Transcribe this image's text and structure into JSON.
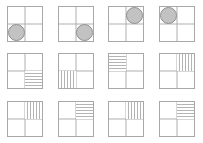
{
  "figure": {
    "title": "",
    "rows": 3,
    "columns": 4,
    "colors": {
      "background": "#ffffff",
      "panel_border": "#a8a8a8",
      "divider_line": "#b0b0b0",
      "circle_fill": "#c2c2c2",
      "circle_stroke": "#8f8f8f",
      "stripe_line": "#b4b4b4"
    }
  },
  "panels": [
    {
      "id": "panel-r1c1",
      "row": 1,
      "column": 1,
      "mark_type": "circle",
      "mark_quadrant": "bottom-left",
      "mark_label": "filled gray circle, bottom-left quadrant"
    },
    {
      "id": "panel-r1c2",
      "row": 1,
      "column": 2,
      "mark_type": "circle",
      "mark_quadrant": "bottom-right",
      "mark_label": "filled gray circle, bottom-right quadrant"
    },
    {
      "id": "panel-r1c3",
      "row": 1,
      "column": 3,
      "mark_type": "circle",
      "mark_quadrant": "top-right",
      "mark_label": "filled gray circle, top-right quadrant"
    },
    {
      "id": "panel-r1c4",
      "row": 1,
      "column": 4,
      "mark_type": "circle",
      "mark_quadrant": "top-left",
      "mark_label": "filled gray circle, top-left quadrant"
    },
    {
      "id": "panel-r2c1",
      "row": 2,
      "column": 1,
      "mark_type": "stripes-horizontal",
      "mark_quadrant": "bottom-right",
      "mark_label": "horizontal stripes, bottom-right quadrant"
    },
    {
      "id": "panel-r2c2",
      "row": 2,
      "column": 2,
      "mark_type": "stripes-vertical",
      "mark_quadrant": "bottom-left",
      "mark_label": "vertical stripes, bottom-left quadrant"
    },
    {
      "id": "panel-r2c3",
      "row": 2,
      "column": 3,
      "mark_type": "stripes-horizontal",
      "mark_quadrant": "top-left",
      "mark_label": "horizontal stripes, top-left quadrant"
    },
    {
      "id": "panel-r2c4",
      "row": 2,
      "column": 4,
      "mark_type": "stripes-vertical",
      "mark_quadrant": "top-right",
      "mark_label": "vertical stripes, top-right quadrant"
    },
    {
      "id": "panel-r3c1",
      "row": 3,
      "column": 1,
      "mark_type": "stripes-vertical",
      "mark_quadrant": "top-right",
      "mark_label": "vertical stripes, top-right quadrant"
    },
    {
      "id": "panel-r3c2",
      "row": 3,
      "column": 2,
      "mark_type": "stripes-horizontal",
      "mark_quadrant": "top-right",
      "mark_label": "horizontal stripes, top-right quadrant"
    },
    {
      "id": "panel-r3c3",
      "row": 3,
      "column": 3,
      "mark_type": "stripes-vertical",
      "mark_quadrant": "top-right",
      "mark_label": "vertical stripes, top-right quadrant"
    },
    {
      "id": "panel-r3c4",
      "row": 3,
      "column": 4,
      "mark_type": "stripes-horizontal",
      "mark_quadrant": "top-right",
      "mark_label": "horizontal stripes, top-right quadrant"
    }
  ]
}
